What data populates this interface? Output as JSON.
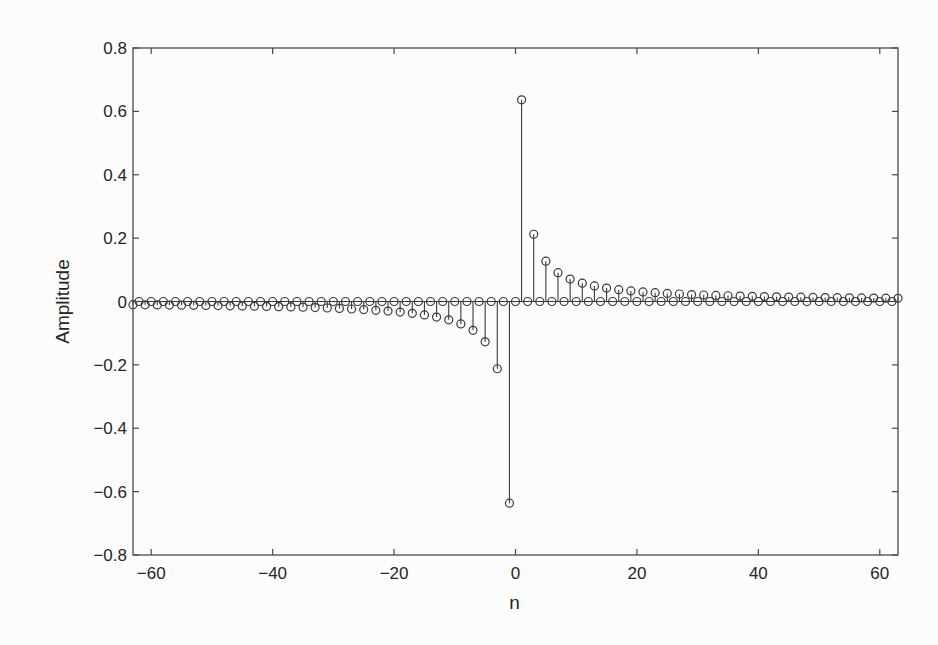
{
  "chart_data": {
    "type": "stem",
    "title": "",
    "xlabel": "n",
    "ylabel": "Amplitude",
    "xlim": [
      -63,
      63
    ],
    "ylim": [
      -0.8,
      0.8
    ],
    "grid": false,
    "legend": null,
    "xticks": [
      -60,
      -40,
      -20,
      0,
      20,
      40,
      60
    ],
    "xtick_labels": [
      "−60",
      "−40",
      "−20",
      "0",
      "20",
      "40",
      "60"
    ],
    "yticks": [
      0.8,
      0.6,
      0.4,
      0.2,
      0,
      -0.2,
      -0.4,
      -0.6,
      -0.8
    ],
    "ytick_labels": [
      "0.8",
      "0.6",
      "0.4",
      "0.2",
      "0",
      "−0.2",
      "−0.4",
      "−0.6",
      "−0.8"
    ],
    "n_range": [
      -63,
      63
    ],
    "series": [
      {
        "name": "h[n]",
        "marker": "open-circle",
        "x": [
          -63,
          -62,
          -61,
          -60,
          -59,
          -58,
          -57,
          -56,
          -55,
          -54,
          -53,
          -52,
          -51,
          -50,
          -49,
          -48,
          -47,
          -46,
          -45,
          -44,
          -43,
          -42,
          -41,
          -40,
          -39,
          -38,
          -37,
          -36,
          -35,
          -34,
          -33,
          -32,
          -31,
          -30,
          -29,
          -28,
          -27,
          -26,
          -25,
          -24,
          -23,
          -22,
          -21,
          -20,
          -19,
          -18,
          -17,
          -16,
          -15,
          -14,
          -13,
          -12,
          -11,
          -10,
          -9,
          -8,
          -7,
          -6,
          -5,
          -4,
          -3,
          -2,
          -1,
          0,
          1,
          2,
          3,
          4,
          5,
          6,
          7,
          8,
          9,
          10,
          11,
          12,
          13,
          14,
          15,
          16,
          17,
          18,
          19,
          20,
          21,
          22,
          23,
          24,
          25,
          26,
          27,
          28,
          29,
          30,
          31,
          32,
          33,
          34,
          35,
          36,
          37,
          38,
          39,
          40,
          41,
          42,
          43,
          44,
          45,
          46,
          47,
          48,
          49,
          50,
          51,
          52,
          53,
          54,
          55,
          56,
          57,
          58,
          59,
          60,
          61,
          62,
          63
        ],
        "values": [
          -0.0101,
          0,
          -0.0104,
          0,
          -0.0108,
          0,
          -0.0112,
          0,
          -0.0116,
          0,
          -0.012,
          0,
          -0.0125,
          0,
          -0.013,
          0,
          -0.0135,
          0,
          -0.0141,
          0,
          -0.0148,
          0,
          -0.0155,
          0,
          -0.0163,
          0,
          -0.0172,
          0,
          -0.0182,
          0,
          -0.0193,
          0,
          -0.0205,
          0,
          -0.022,
          0,
          -0.0236,
          0,
          -0.0255,
          0,
          -0.0277,
          0,
          -0.0303,
          0,
          -0.0335,
          0,
          -0.0374,
          0,
          -0.0424,
          0,
          -0.049,
          0,
          -0.0579,
          0,
          -0.0707,
          0,
          -0.0909,
          0,
          -0.1273,
          0,
          -0.2122,
          0,
          -0.6366,
          0,
          0.6366,
          0,
          0.2122,
          0,
          0.1273,
          0,
          0.0909,
          0,
          0.0707,
          0,
          0.0579,
          0,
          0.049,
          0,
          0.0424,
          0,
          0.0374,
          0,
          0.0335,
          0,
          0.0303,
          0,
          0.0277,
          0,
          0.0255,
          0,
          0.0236,
          0,
          0.022,
          0,
          0.0205,
          0,
          0.0193,
          0,
          0.0182,
          0,
          0.0172,
          0,
          0.0163,
          0,
          0.0155,
          0,
          0.0148,
          0,
          0.0141,
          0,
          0.0135,
          0,
          0.013,
          0,
          0.0125,
          0,
          0.012,
          0,
          0.0116,
          0,
          0.0112,
          0,
          0.0108,
          0,
          0.0104,
          0,
          0.0101
        ]
      }
    ],
    "colors": {
      "line": "#3a3a3a",
      "marker": "#3a3a3a",
      "axis": "#4a4a4a",
      "background": "#fcfcfc"
    }
  }
}
